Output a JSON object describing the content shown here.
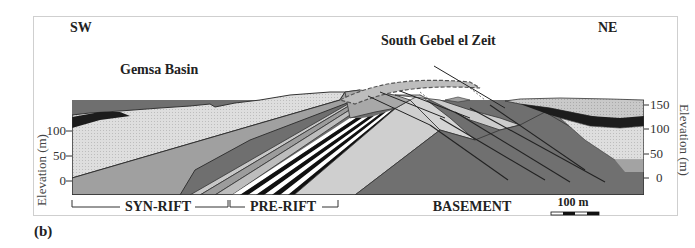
{
  "figure": {
    "panel_label": "(b)",
    "direction_left": "SW",
    "direction_right": "NE",
    "location_left": "Gemsa Basin",
    "location_right": "South Gebel el Zeit",
    "axis_left": {
      "title": "Elevation (m)",
      "ticks": [
        "150",
        "100",
        "50",
        "0"
      ]
    },
    "axis_right": {
      "title": "Elevation (m)",
      "ticks": [
        "150",
        "100",
        "50",
        "0"
      ]
    },
    "units": {
      "syn_rift": "SYN-RIFT",
      "pre_rift": "PRE-RIFT",
      "basement": "BASEMENT"
    },
    "scale_bar": {
      "label": "100 m"
    },
    "colors": {
      "light_stipple": "#dcdcdc",
      "mid_gray": "#9a9a9a",
      "light_gray": "#c4c4c4",
      "basement": "#6e6e6e",
      "dark_band": "#1a1a1a",
      "outline": "#333333"
    }
  }
}
